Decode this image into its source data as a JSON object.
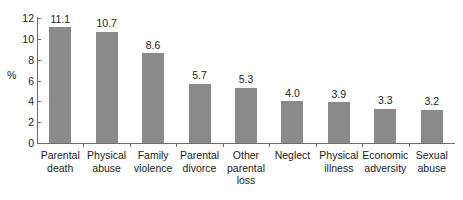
{
  "chart_data": {
    "type": "bar",
    "title": "",
    "xlabel": "",
    "ylabel": "%",
    "ylim": [
      0,
      12
    ],
    "yticks": [
      0,
      2,
      4,
      6,
      8,
      10,
      12
    ],
    "ytick_labels": [
      "0",
      "2",
      "4",
      "6",
      "8",
      "10",
      "12"
    ],
    "grid": false,
    "legend": null,
    "bar_color": "#8a8a8a",
    "axis_color": "#6d6d6d",
    "text_color": "#1b1b1b",
    "value_label_format": "one-decimal",
    "categories": [
      "Parental death",
      "Physical abuse",
      "Family violence",
      "Parental divorce",
      "Other parental loss",
      "Neglect",
      "Physical illness",
      "Economic adversity",
      "Sexual abuse"
    ],
    "category_lines": [
      [
        "Parental",
        "death"
      ],
      [
        "Physical",
        "abuse"
      ],
      [
        "Family",
        "violence"
      ],
      [
        "Parental",
        "divorce"
      ],
      [
        "Other",
        "parental",
        "loss"
      ],
      [
        "Neglect"
      ],
      [
        "Physical",
        "illness"
      ],
      [
        "Economic",
        "adversity"
      ],
      [
        "Sexual",
        "abuse"
      ]
    ],
    "values": [
      11.1,
      10.7,
      8.6,
      5.7,
      5.3,
      4.0,
      3.9,
      3.3,
      3.2
    ],
    "value_labels": [
      "11.1",
      "10.7",
      "8.6",
      "5.7",
      "5.3",
      "4.0",
      "3.9",
      "3.3",
      "3.2"
    ]
  }
}
